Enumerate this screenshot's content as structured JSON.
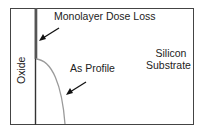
{
  "diagram": {
    "labels": {
      "monolayer": "Monolayer Dose Loss",
      "as_profile": "As Profile",
      "silicon_line1": "Silicon",
      "silicon_line2": "Substrate",
      "oxide": "Oxide"
    },
    "colors": {
      "border": "#333333",
      "oxide_interface": "#333333",
      "monolayer_segment": "#555555",
      "profile_curve": "#999999",
      "arrow": "#111111",
      "text": "#222222"
    }
  }
}
